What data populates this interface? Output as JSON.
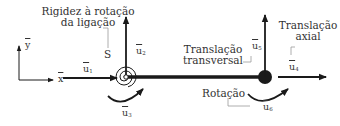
{
  "labels": {
    "rotational_stiffness_line1": "Rigidez à rotação",
    "rotational_stiffness_line2": "da ligação",
    "spring_symbol": "S",
    "transverse_translation_line1": "Translação",
    "transverse_translation_line2": "transversal",
    "axial_translation_line1": "Translação",
    "axial_translation_line2": "axial",
    "rotation": "Rotação"
  },
  "axes": {
    "x": "x",
    "y": "y"
  },
  "dofs": [
    {
      "symbol": "u",
      "index": "1",
      "type": "translation-x-start"
    },
    {
      "symbol": "u",
      "index": "2",
      "type": "translation-y-start"
    },
    {
      "symbol": "u",
      "index": "3",
      "type": "rotation-start"
    },
    {
      "symbol": "u",
      "index": "4",
      "type": "translation-x-end"
    },
    {
      "symbol": "u",
      "index": "5",
      "type": "translation-y-end"
    },
    {
      "symbol": "u",
      "index": "6",
      "type": "rotation-end"
    }
  ],
  "colors": {
    "ink": "#1a1a1a",
    "text": "#333333",
    "leader": "#9a9a9a"
  }
}
